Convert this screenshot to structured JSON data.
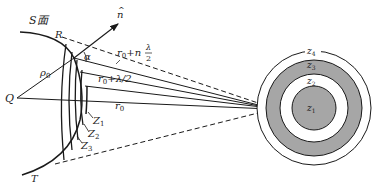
{
  "left_figure": {
    "surface_label": "S面",
    "point_R": "R",
    "point_T": "T",
    "point_Q": "Q",
    "point_P": "P",
    "normal_label": "n̂",
    "normal_hat": "^",
    "normal_letter": "n",
    "angle_label": "α",
    "rho_label": "ρ",
    "rho_sub": "0",
    "r0_label": "r",
    "r0_sub": "0",
    "r_half_label": "r",
    "r_half_sub": "0",
    "r_half_tail": "+λ/2",
    "r_n_label": "r",
    "r_n_sub": "0",
    "r_n_mid": "+n",
    "r_n_frac_num": "λ",
    "r_n_frac_den": "2",
    "zone_labels": [
      {
        "main": "Z",
        "sub": "1"
      },
      {
        "main": "Z",
        "sub": "2"
      },
      {
        "main": "Z",
        "sub": "3"
      }
    ]
  },
  "right_figure": {
    "zones": [
      {
        "main": "z",
        "sub": "1",
        "fill": "#a6a6a6"
      },
      {
        "main": "z",
        "sub": "2",
        "fill": "#ffffff"
      },
      {
        "main": "z",
        "sub": "3",
        "fill": "#a6a6a6"
      },
      {
        "main": "z",
        "sub": "4",
        "fill": "#ffffff"
      }
    ]
  },
  "colors": {
    "stroke": "#1a1a1a",
    "shaded_zone": "#a6a6a6"
  }
}
